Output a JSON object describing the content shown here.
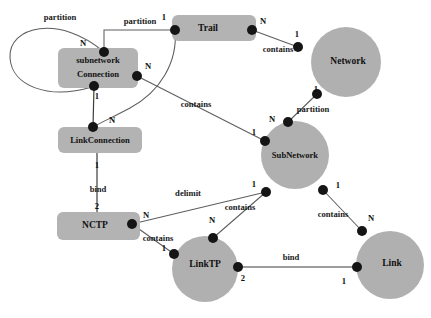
{
  "diagram": {
    "palette": {
      "background": "#ffffff",
      "node_fill": "#b0b0b0",
      "rect_fill": "#b3b3b3",
      "edge_stroke": "#5d5d5d",
      "dot_fill": "#151515",
      "text": "#111111"
    },
    "nodes": [
      {
        "id": "subnetworkConnection",
        "shape": "rect",
        "line1": "subnetwork",
        "line2": "Connection",
        "x": 58,
        "y": 48,
        "w": 80,
        "h": 40
      },
      {
        "id": "trail",
        "shape": "rect",
        "label": "Trail",
        "x": 172,
        "y": 15,
        "w": 84,
        "h": 26
      },
      {
        "id": "linkConnection",
        "shape": "rect",
        "label": "LinkConnection",
        "x": 58,
        "y": 127,
        "w": 84,
        "h": 26
      },
      {
        "id": "nctp",
        "shape": "rect",
        "label": "NCTP",
        "x": 57,
        "y": 212,
        "w": 83,
        "h": 28
      },
      {
        "id": "network",
        "shape": "circle",
        "label": "Network",
        "cx": 346,
        "cy": 62,
        "r": 35
      },
      {
        "id": "subNetwork",
        "shape": "circle",
        "label": "SubNetwork",
        "cx": 295,
        "cy": 155,
        "r": 34
      },
      {
        "id": "linkTP",
        "shape": "circle",
        "label": "LinkTP",
        "cx": 205,
        "cy": 269,
        "r": 33
      },
      {
        "id": "link",
        "shape": "circle",
        "label": "Link",
        "cx": 390,
        "cy": 265,
        "r": 34
      }
    ],
    "edges": [
      {
        "id": "partition-self",
        "label": "partition",
        "label_x": 60,
        "label_y": 18,
        "from": "subnetworkConnection",
        "to": "subnetworkConnection",
        "from_card": "N",
        "to_card": "1"
      },
      {
        "id": "partition-trail",
        "label": "partition",
        "label_x": 140,
        "label_y": 22,
        "from": "trail",
        "to": "subnetworkConnection",
        "from_card": "1",
        "to_card": "N"
      },
      {
        "id": "contains-trail-network",
        "label": "contains",
        "label_x": 278,
        "label_y": 50,
        "from": "trail",
        "to": "network",
        "from_card": "N",
        "to_card": "1"
      },
      {
        "id": "partition-network-subnetwork",
        "label": "partition",
        "label_x": 313,
        "label_y": 110,
        "from": "network",
        "to": "subNetwork",
        "from_card": "1",
        "to_card": "N"
      },
      {
        "id": "contains-snc-subnetwork",
        "label": "contains",
        "label_x": 196,
        "label_y": 105,
        "from": "subnetworkConnection",
        "to": "subNetwork",
        "from_card": "N",
        "to_card": "1"
      },
      {
        "id": "trail-linkconnection",
        "label": "",
        "label_x": 0,
        "label_y": 0,
        "from": "trail",
        "to": "linkConnection",
        "from_card": "N",
        "to_card": "N"
      },
      {
        "id": "snc-linkconnection",
        "label": "",
        "label_x": 0,
        "label_y": 0,
        "from": "subnetworkConnection",
        "to": "linkConnection",
        "from_card": "1",
        "to_card": ""
      },
      {
        "id": "bind-linkconnection-nctp",
        "label": "bind",
        "label_x": 98,
        "label_y": 190,
        "from": "linkConnection",
        "to": "nctp",
        "from_card": "1",
        "to_card": "2"
      },
      {
        "id": "delimit-nctp-subnetwork",
        "label": "delimit",
        "label_x": 188,
        "label_y": 194,
        "from": "nctp",
        "to": "subNetwork",
        "from_card": "N",
        "to_card": "1"
      },
      {
        "id": "contains-nctp-linktp",
        "label": "contains",
        "label_x": 158,
        "label_y": 239,
        "from": "nctp",
        "to": "linkTP",
        "from_card": "N",
        "to_card": "1"
      },
      {
        "id": "contains-subnetwork-linktp",
        "label": "contains",
        "label_x": 240,
        "label_y": 208,
        "from": "subNetwork",
        "to": "linkTP",
        "from_card": "1",
        "to_card": "N"
      },
      {
        "id": "contains-subnetwork-link",
        "label": "contains",
        "label_x": 333,
        "label_y": 215,
        "from": "subNetwork",
        "to": "link",
        "from_card": "1",
        "to_card": "N"
      },
      {
        "id": "bind-linktp-link",
        "label": "bind",
        "label_x": 291,
        "label_y": 258,
        "from": "linkTP",
        "to": "link",
        "from_card": "2",
        "to_card": "1"
      }
    ],
    "cardinalities": [
      {
        "id": "card-snc-top-N",
        "text": "N",
        "x": 83,
        "y": 44
      },
      {
        "id": "card-snc-right-N",
        "text": "N",
        "x": 148,
        "y": 67
      },
      {
        "id": "card-snc-bottom-1",
        "text": "1",
        "x": 97,
        "y": 97
      },
      {
        "id": "card-trail-left-1",
        "text": "1",
        "x": 164,
        "y": 18
      },
      {
        "id": "card-trail-right-N",
        "text": "N",
        "x": 263,
        "y": 22
      },
      {
        "id": "card-network-left-1",
        "text": "1",
        "x": 297,
        "y": 35
      },
      {
        "id": "card-network-bottom-1",
        "text": "1",
        "x": 316,
        "y": 90
      },
      {
        "id": "card-subnetwork-top-N",
        "text": "N",
        "x": 272,
        "y": 120
      },
      {
        "id": "card-subnetwork-left-1",
        "text": "1",
        "x": 254,
        "y": 133
      },
      {
        "id": "card-subnetwork-bl-1",
        "text": "1",
        "x": 254,
        "y": 185
      },
      {
        "id": "card-subnetwork-br-1",
        "text": "1",
        "x": 338,
        "y": 186
      },
      {
        "id": "card-linkconnection-N",
        "text": "N",
        "x": 112,
        "y": 121
      },
      {
        "id": "card-linkconnection-1",
        "text": "1",
        "x": 97,
        "y": 166
      },
      {
        "id": "card-nctp-2",
        "text": "2",
        "x": 97,
        "y": 207
      },
      {
        "id": "card-nctp-N",
        "text": "N",
        "x": 146,
        "y": 216
      },
      {
        "id": "card-linktp-left-1",
        "text": "1",
        "x": 164,
        "y": 249
      },
      {
        "id": "card-linktp-top-N",
        "text": "N",
        "x": 212,
        "y": 221
      },
      {
        "id": "card-linktp-right-2",
        "text": "2",
        "x": 243,
        "y": 279
      },
      {
        "id": "card-link-top-N",
        "text": "N",
        "x": 371,
        "y": 219
      },
      {
        "id": "card-link-left-1",
        "text": "1",
        "x": 344,
        "y": 282
      }
    ],
    "dots": [
      {
        "id": "dot-snc-top",
        "x": 104,
        "y": 52
      },
      {
        "id": "dot-snc-right",
        "x": 137,
        "y": 76
      },
      {
        "id": "dot-snc-bottom",
        "x": 94,
        "y": 86
      },
      {
        "id": "dot-trail-left",
        "x": 175,
        "y": 30
      },
      {
        "id": "dot-trail-right",
        "x": 252,
        "y": 30
      },
      {
        "id": "dot-network-left",
        "x": 298,
        "y": 47
      },
      {
        "id": "dot-network-bottom",
        "x": 317,
        "y": 94
      },
      {
        "id": "dot-subnetwork-top",
        "x": 288,
        "y": 122
      },
      {
        "id": "dot-subnetwork-left",
        "x": 265,
        "y": 141
      },
      {
        "id": "dot-subnetwork-bl",
        "x": 266,
        "y": 192
      },
      {
        "id": "dot-subnetwork-br",
        "x": 323,
        "y": 190
      },
      {
        "id": "dot-linkconnection-top",
        "x": 93,
        "y": 127
      },
      {
        "id": "dot-nctp-right",
        "x": 132,
        "y": 224
      },
      {
        "id": "dot-linktp-left",
        "x": 174,
        "y": 254
      },
      {
        "id": "dot-linktp-top",
        "x": 213,
        "y": 238
      },
      {
        "id": "dot-linktp-right",
        "x": 238,
        "y": 267
      },
      {
        "id": "dot-link-top",
        "x": 362,
        "y": 231
      },
      {
        "id": "dot-link-left",
        "x": 357,
        "y": 267
      }
    ]
  }
}
